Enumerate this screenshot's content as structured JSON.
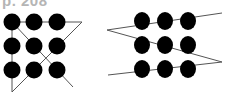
{
  "page_label": "p. 208",
  "colors": {
    "dot": "#000000",
    "line": "#555555",
    "label": "#b5b5b5"
  },
  "puzzles": [
    {
      "name": "nine-dots-solution-a",
      "grid": "3x3",
      "line_segments": 4,
      "description": "Four connected lines through nine dots, extending beyond the grid"
    },
    {
      "name": "nine-dots-solution-b",
      "grid": "3x3",
      "line_segments": 4,
      "description": "Zigzag line through nine dots, extending beyond the grid"
    }
  ]
}
